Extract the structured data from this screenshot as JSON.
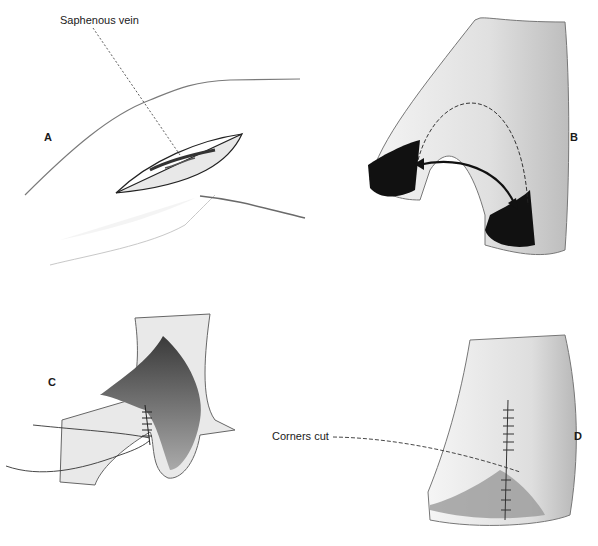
{
  "figure": {
    "panels": [
      {
        "id": "A",
        "letter": "A",
        "callout": "Saphenous vein",
        "subject": "leg incision exposing saphenous vein"
      },
      {
        "id": "B",
        "letter": "B",
        "subject": "vein bifurcation with branch ends opened, arrow showing flap rotation"
      },
      {
        "id": "C",
        "letter": "C",
        "subject": "suturing opened branches together"
      },
      {
        "id": "D",
        "letter": "D",
        "callout": "Corners cut",
        "subject": "completed sutured patch with corners trimmed"
      }
    ]
  },
  "colors": {
    "ink": "#1a1a1a",
    "shade": "#9a9a9a",
    "lumen": "#111111",
    "background": "#ffffff"
  }
}
